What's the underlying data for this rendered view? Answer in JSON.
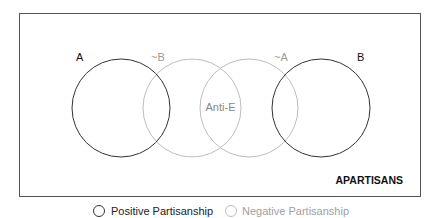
{
  "diagram": {
    "labels": {
      "a": "A",
      "not_b": "~B",
      "anti_e": "Anti-E",
      "not_a": "~A",
      "b": "B",
      "apartisans": "APARTISANS"
    },
    "colors": {
      "positive": "#333333",
      "negative": "#b5b5b5",
      "frame": "#555555",
      "text_dark": "#111111",
      "text_light": "#9a9a9a"
    }
  },
  "legend": {
    "items": [
      {
        "label": "Positive Partisanship",
        "style": "dark"
      },
      {
        "label": "Negative Partisanship",
        "style": "light"
      }
    ]
  }
}
